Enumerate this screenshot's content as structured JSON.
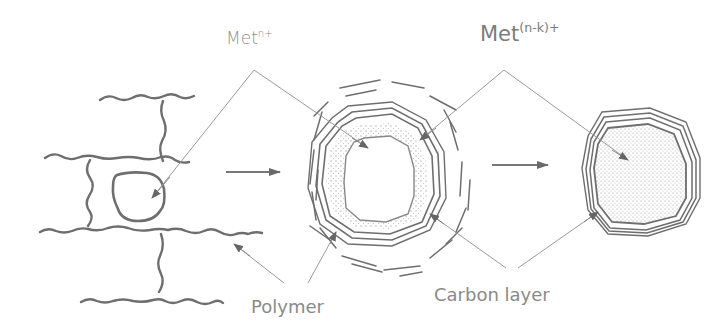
{
  "labels": {
    "met_n": {
      "base": "Met",
      "sup": "n+"
    },
    "met_nk": {
      "base": "Met",
      "sup": "(n-k)+"
    },
    "polymer": "Polymer",
    "carbon_layer": "Carbon layer"
  },
  "stages": [
    "polymer-network-with-metal-ion",
    "metal-core-with-carbon-layers",
    "reduced-metal-particle-with-carbon-shell"
  ],
  "colors": {
    "stroke": "#6e6e6e",
    "leader": "#9a9a9a",
    "text": "#8a8a8a"
  }
}
